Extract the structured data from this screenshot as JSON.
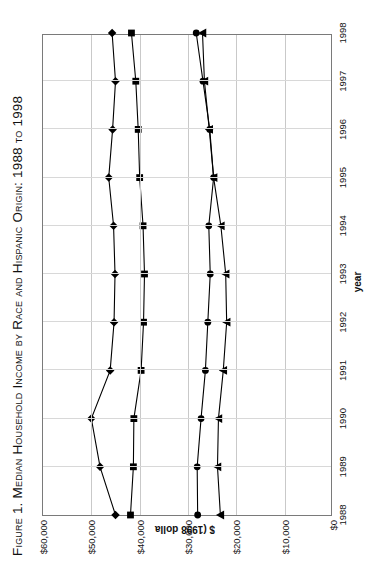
{
  "figure": {
    "title": "Figure 1. Median Household Income by Race and Hispanic Origin: 1988 to 1998"
  },
  "chart_data": {
    "type": "line",
    "title": "Figure 1. Median Household Income by Race and Hispanic Origin: 1988 to 1998",
    "xlabel": "year",
    "ylabel": "$ (1998 dolla",
    "x": [
      1988,
      1989,
      1990,
      1991,
      1992,
      1993,
      1994,
      1995,
      1996,
      1997,
      1998
    ],
    "categories": [
      "1988",
      "1989",
      "1990",
      "1991",
      "1992",
      "1993",
      "1994",
      "1995",
      "1996",
      "1997",
      "1998"
    ],
    "ylim": [
      0,
      60000
    ],
    "yticks": [
      0,
      10000,
      20000,
      30000,
      40000,
      50000,
      60000
    ],
    "ytick_labels": [
      "$0",
      "$10,000",
      "$20,000",
      "$30,000",
      "$40,000",
      "$50,000",
      "$60,000"
    ],
    "xtick_labels": [
      "1988",
      "1989",
      "1990",
      "1991",
      "1992",
      "1993",
      "1994",
      "1995",
      "1996",
      "1997",
      "1998"
    ],
    "grid": true,
    "legend": "none",
    "series": [
      {
        "name": "series-diamond",
        "marker": "diamond",
        "color": "#000000",
        "values": [
          45000,
          48200,
          50000,
          46100,
          45300,
          45100,
          45400,
          46400,
          45600,
          45000,
          45700
        ]
      },
      {
        "name": "series-square",
        "marker": "square",
        "color": "#000000",
        "values": [
          41900,
          41300,
          41200,
          39700,
          39200,
          39000,
          39300,
          40000,
          40300,
          40800,
          41700
        ]
      },
      {
        "name": "series-circle",
        "marker": "circle",
        "color": "#000000",
        "values": [
          28000,
          28100,
          27300,
          26400,
          25900,
          25400,
          25700,
          24700,
          25500,
          26900,
          28300
        ]
      },
      {
        "name": "series-triangle",
        "marker": "triangle",
        "color": "#000000",
        "values": [
          23300,
          23900,
          23700,
          22700,
          22000,
          22200,
          23200,
          24700,
          25600,
          26600,
          27000
        ]
      }
    ]
  }
}
